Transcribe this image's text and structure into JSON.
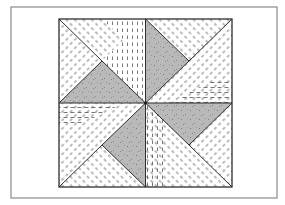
{
  "figure": {
    "frame": {
      "x": 11,
      "y": 7,
      "w": 266,
      "h": 191,
      "stroke": "#8a8a8a"
    },
    "block": {
      "x": 59,
      "y": 19,
      "w": 173,
      "h": 168,
      "stroke": "#3a3a3a"
    },
    "colors": {
      "background": "#ffffff",
      "shaded_fill": "#b8b8b8",
      "shaded_speckle": "#7a7a7a",
      "hatch": "#555555",
      "outline": "#2e2e2e"
    },
    "quadrants": [
      {
        "name": "top-left",
        "shaded_triangle": "bottom",
        "diagonal": "top-left-corner-to-quadrant-center"
      },
      {
        "name": "top-right",
        "shaded_triangle": "left",
        "diagonal": "top-right-corner-to-quadrant-center"
      },
      {
        "name": "bottom-left",
        "shaded_triangle": "right",
        "diagonal": "bottom-left-corner-to-quadrant-center"
      },
      {
        "name": "bottom-right",
        "shaded_triangle": "top",
        "diagonal": "bottom-right-corner-to-quadrant-center"
      }
    ]
  }
}
